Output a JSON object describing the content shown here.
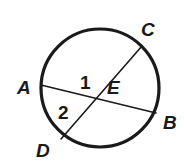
{
  "figure": {
    "kind": "circle-with-two-intersecting-chords",
    "background_color": "#ffffff",
    "stroke_color": "#1a1a1a",
    "label_color": "#1a1a1a",
    "circle": {
      "center_x": 100,
      "center_y": 88,
      "radius": 59,
      "stroke_width": 3.2
    },
    "chords": [
      {
        "name": "chord-ab",
        "from": "A",
        "to": "B",
        "x1": 41,
        "y1": 85,
        "x2": 156,
        "y2": 113,
        "stroke_width": 1.6
      },
      {
        "name": "chord-cd",
        "from": "C",
        "to": "D",
        "x1": 142,
        "y1": 46,
        "x2": 61,
        "y2": 139,
        "stroke_width": 1.6
      }
    ],
    "intersection": {
      "name": "E",
      "x": 89,
      "y": 94
    },
    "point_labels": [
      {
        "id": "A",
        "text": "A",
        "x": 17,
        "y": 94
      },
      {
        "id": "B",
        "text": "B",
        "x": 163,
        "y": 129
      },
      {
        "id": "C",
        "text": "C",
        "x": 141,
        "y": 36
      },
      {
        "id": "D",
        "text": "D",
        "x": 36,
        "y": 157
      },
      {
        "id": "E",
        "text": "E",
        "x": 107,
        "y": 94
      }
    ],
    "angle_labels": [
      {
        "id": "1",
        "text": "1",
        "x": 80,
        "y": 89
      },
      {
        "id": "2",
        "text": "2",
        "x": 58,
        "y": 119
      }
    ]
  }
}
